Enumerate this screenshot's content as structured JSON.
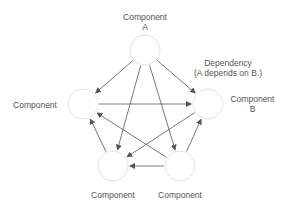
{
  "diagram": {
    "colors": {
      "node_fill": "#ffffff",
      "node_stroke": "#e4e4e4",
      "edge": "#555555",
      "text": "#555555"
    },
    "nodes": [
      {
        "id": "A",
        "label_line1": "Component",
        "label_line2": "A",
        "cx": 145,
        "cy": 50
      },
      {
        "id": "L",
        "label_line1": "Component",
        "label_line2": "",
        "cx": 83,
        "cy": 104
      },
      {
        "id": "B",
        "label_line1": "Component",
        "label_line2": "B",
        "cx": 208,
        "cy": 104
      },
      {
        "id": "BL",
        "label_line1": "Component",
        "label_line2": "",
        "cx": 113,
        "cy": 166
      },
      {
        "id": "BR",
        "label_line1": "Component",
        "label_line2": "",
        "cx": 180,
        "cy": 166
      }
    ],
    "edges": [
      {
        "from": "A",
        "to": "L"
      },
      {
        "from": "A",
        "to": "B"
      },
      {
        "from": "A",
        "to": "BL"
      },
      {
        "from": "A",
        "to": "BR"
      },
      {
        "from": "L",
        "to": "B"
      },
      {
        "from": "B",
        "to": "BL"
      },
      {
        "from": "BR",
        "to": "L"
      },
      {
        "from": "BR",
        "to": "BL"
      },
      {
        "from": "BL",
        "to": "L"
      },
      {
        "from": "BR",
        "to": "B"
      }
    ],
    "annotation": {
      "line1": "Dependency",
      "line2": "(A depends on B.)"
    }
  }
}
